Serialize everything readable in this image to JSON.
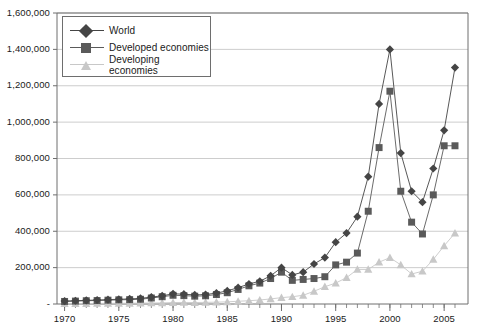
{
  "chart_data": {
    "type": "line",
    "title": "",
    "subtitle": "",
    "xlabel": "",
    "ylabel": "",
    "grid": true,
    "legend_position": "top-left",
    "xlim": [
      1969.3,
      2007.2
    ],
    "ylim": [
      0,
      1600000
    ],
    "x_tick_labels": [
      "1970",
      "1975",
      "1980",
      "1985",
      "1990",
      "1995",
      "2000",
      "2005"
    ],
    "x_tick_values": [
      1970,
      1975,
      1980,
      1985,
      1990,
      1995,
      2000,
      2005
    ],
    "x_minor_ticks_annual": true,
    "y_tick_labels": [
      "-",
      "200,000",
      "400,000",
      "600,000",
      "800,000",
      "1,000,000",
      "1,200,000",
      "1,400,000",
      "1,600,000"
    ],
    "y_tick_values": [
      0,
      200000,
      400000,
      600000,
      800000,
      1000000,
      1200000,
      1400000,
      1600000
    ],
    "x": [
      1970,
      1971,
      1972,
      1973,
      1974,
      1975,
      1976,
      1977,
      1978,
      1979,
      1980,
      1981,
      1982,
      1983,
      1984,
      1985,
      1986,
      1987,
      1988,
      1989,
      1990,
      1991,
      1992,
      1993,
      1994,
      1995,
      1996,
      1997,
      1998,
      1999,
      2000,
      2001,
      2002,
      2003,
      2004,
      2005,
      2006
    ],
    "series": [
      {
        "name": "World",
        "color": "#454545",
        "marker": "diamond",
        "values": [
          16000,
          18000,
          20000,
          22000,
          24000,
          26000,
          28000,
          31000,
          38000,
          45000,
          56000,
          54000,
          50000,
          52000,
          60000,
          72000,
          90000,
          110000,
          125000,
          155000,
          200000,
          160000,
          175000,
          220000,
          255000,
          340000,
          390000,
          480000,
          700000,
          1100000,
          1400000,
          830000,
          620000,
          560000,
          745000,
          955000,
          1300000
        ]
      },
      {
        "name": "Developed economies",
        "color": "#5a5a5a",
        "marker": "square",
        "values": [
          14000,
          16000,
          18000,
          19000,
          21000,
          23000,
          24000,
          26000,
          33000,
          40000,
          48000,
          46000,
          43000,
          45000,
          52000,
          62000,
          80000,
          100000,
          115000,
          140000,
          175000,
          130000,
          135000,
          140000,
          150000,
          215000,
          230000,
          280000,
          510000,
          860000,
          1170000,
          620000,
          450000,
          385000,
          600000,
          870000,
          870000
        ]
      },
      {
        "name": "Developing economies",
        "color": "#c8c8c8",
        "marker": "triangle",
        "values": [
          2000,
          2200,
          2500,
          3000,
          3500,
          3800,
          4000,
          5000,
          5500,
          6000,
          8000,
          8500,
          8000,
          9000,
          10000,
          12000,
          15000,
          18000,
          22000,
          28000,
          35000,
          40000,
          48000,
          70000,
          95000,
          115000,
          145000,
          190000,
          190000,
          230000,
          255000,
          215000,
          165000,
          180000,
          245000,
          320000,
          390000
        ]
      }
    ]
  },
  "legend": {
    "items": [
      {
        "label": "World"
      },
      {
        "label": "Developed economies"
      },
      {
        "label": "Developing economies"
      }
    ]
  },
  "colors": {
    "world": "#454545",
    "developed": "#5a5a5a",
    "developing": "#c8c8c8",
    "grid": "#c0c0c0",
    "axis": "#6e6e6e",
    "text": "#1a1a1a"
  }
}
